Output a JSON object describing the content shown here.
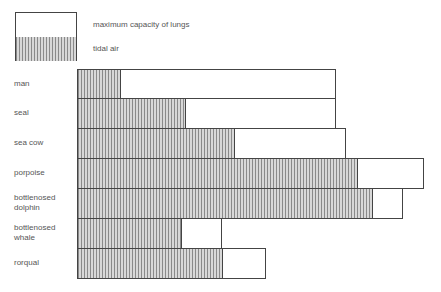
{
  "chart_data": {
    "type": "bar",
    "orientation": "horizontal",
    "title": "",
    "xlabel": "",
    "ylabel": "",
    "units": "relative length (no axis shown)",
    "categories": [
      "man",
      "seal",
      "sea cow",
      "porpoise",
      "bottlenosed dolphin",
      "bottlenosed whale",
      "rorqual"
    ],
    "series": [
      {
        "name": "maximum capacity of lungs",
        "values": [
          259,
          259,
          269,
          347,
          326,
          145,
          189
        ]
      },
      {
        "name": "tidal air",
        "values": [
          43,
          108,
          157,
          280,
          295,
          104,
          145
        ]
      }
    ],
    "legend": [
      {
        "label": "maximum capacity of lungs",
        "pattern": "blank"
      },
      {
        "label": "tidal air",
        "pattern": "vertical-hatch"
      }
    ],
    "grid": false,
    "legend_position": "top-left"
  },
  "legend": {
    "max_label": "maximum capacity of lungs",
    "tidal_label": "tidal air"
  },
  "rows": [
    {
      "label1": "man",
      "label2": "",
      "tidal": 43,
      "total": 259
    },
    {
      "label1": "seal",
      "label2": "",
      "tidal": 108,
      "total": 259
    },
    {
      "label1": "sea cow",
      "label2": "",
      "tidal": 157,
      "total": 269
    },
    {
      "label1": "porpoise",
      "label2": "",
      "tidal": 280,
      "total": 347
    },
    {
      "label1": "bottlenosed",
      "label2": "dolphin",
      "tidal": 295,
      "total": 326
    },
    {
      "label1": "bottlenosed",
      "label2": "whale",
      "tidal": 104,
      "total": 145
    },
    {
      "label1": "rorqual",
      "label2": "",
      "tidal": 145,
      "total": 189
    }
  ]
}
